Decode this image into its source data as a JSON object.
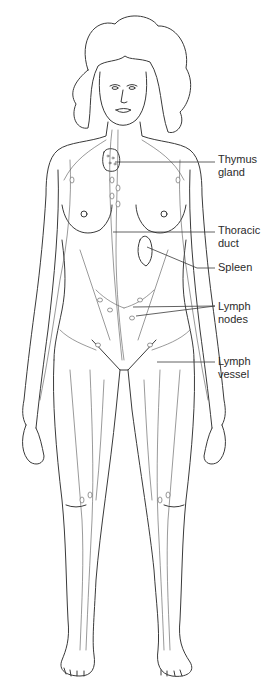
{
  "figure": {
    "line_color": "#3a3a3a",
    "background": "#ffffff"
  },
  "labels": [
    {
      "id": "thymus-gland",
      "lines": [
        "Thymus",
        "gland"
      ],
      "top": 153,
      "leader": {
        "from": [
          115,
          162
        ],
        "to": [
          215,
          162
        ]
      }
    },
    {
      "id": "thoracic-duct",
      "lines": [
        "Thoracic",
        "duct"
      ],
      "top": 224,
      "leader": {
        "from": [
          113,
          232
        ],
        "to": [
          215,
          232
        ]
      }
    },
    {
      "id": "spleen",
      "lines": [
        "Spleen"
      ],
      "top": 261,
      "leader": {
        "from": [
          147,
          247
        ],
        "via": [
          197,
          268
        ],
        "to": [
          215,
          268
        ]
      }
    },
    {
      "id": "lymph-nodes",
      "lines": [
        "Lymph",
        "nodes"
      ],
      "top": 300,
      "leader": {
        "from": [
          133,
          307
        ],
        "from2": [
          136,
          316
        ],
        "to": [
          215,
          306
        ]
      }
    },
    {
      "id": "lymph-vessel",
      "lines": [
        "Lymph",
        "vessel"
      ],
      "top": 355,
      "leader": {
        "from": [
          157,
          362
        ],
        "to": [
          215,
          362
        ]
      }
    }
  ]
}
